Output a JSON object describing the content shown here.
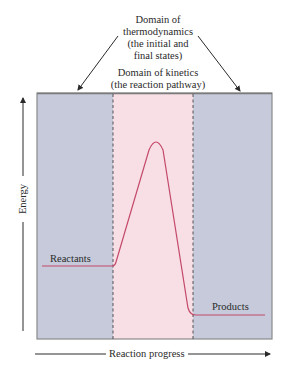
{
  "figure": {
    "title_thermo": [
      "Domain of",
      "thermodynamics",
      "(the initial and",
      "final states)"
    ],
    "title_kinetics": [
      "Domain of kinetics",
      "(the reaction pathway)"
    ],
    "reactants_label": "Reactants",
    "products_label": "Products",
    "x_axis_label": "Reaction progress",
    "y_axis_label": "Energy",
    "colors": {
      "thermo_region": "#c6cadb",
      "kinetics_region": "#f8dfe5",
      "curve": "#c44a6a",
      "frame": "#8a8a8a",
      "text": "#2a2a2a"
    },
    "regions": [
      {
        "name": "initial-state",
        "domain": "thermodynamics"
      },
      {
        "name": "reaction-pathway",
        "domain": "kinetics"
      },
      {
        "name": "final-state",
        "domain": "thermodynamics"
      }
    ],
    "curve_shape": "energy profile: flat reactants level, rise to single activation peak, drop to lower flat products level"
  }
}
